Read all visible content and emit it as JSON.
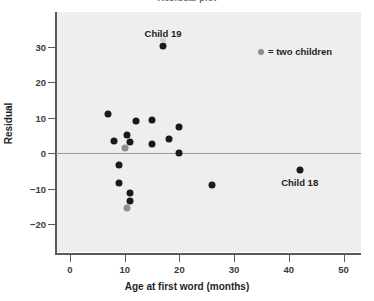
{
  "figure": {
    "clipped_title": "Residual plot"
  },
  "legend": {
    "marker_name": "two-children-marker",
    "text": "= two children",
    "color": "#8d8d8d"
  },
  "annotations": [
    {
      "name": "child-19-label",
      "text": "Child 19",
      "x": 17,
      "y": 33.5
    },
    {
      "name": "child-18-label",
      "text": "Child 18",
      "x": 42,
      "y": -8.5
    }
  ],
  "chart_data": {
    "type": "scatter",
    "title": "Residual plot",
    "xlabel": "Age at first word (months)",
    "ylabel": "Residual",
    "xlim": [
      -3,
      56
    ],
    "ylim": [
      -23,
      35
    ],
    "xticks": [
      0,
      10,
      20,
      30,
      40,
      50
    ],
    "yticks": [
      -20,
      -10,
      0,
      10,
      20,
      30
    ],
    "xtick_labels": [
      "0",
      "10",
      "20",
      "30",
      "40",
      "50"
    ],
    "ytick_labels": [
      "−20",
      "−10",
      "0",
      "10",
      "20",
      "30"
    ],
    "grid": false,
    "reference_line": {
      "y": 0,
      "color": "#9a9a9a"
    },
    "panel_color": "#eeeeee",
    "legend_position": "upper-right",
    "series": [
      {
        "name": "one child",
        "color": "#1a1a1a",
        "points": [
          [
            7.0,
            11.0
          ],
          [
            8.0,
            3.5
          ],
          [
            9.0,
            -3.5
          ],
          [
            9.0,
            -8.5
          ],
          [
            10.5,
            5.0
          ],
          [
            11.0,
            3.0
          ],
          [
            11.0,
            -11.2
          ],
          [
            11.0,
            -13.5
          ],
          [
            12.0,
            9.1
          ],
          [
            15.0,
            9.3
          ],
          [
            15.0,
            2.5
          ],
          [
            17.0,
            30.1
          ],
          [
            18.0,
            4.0
          ],
          [
            20.0,
            7.2
          ],
          [
            20.0,
            0.0
          ],
          [
            26.0,
            -9.1
          ],
          [
            42.0,
            -4.8
          ]
        ]
      },
      {
        "name": "two children",
        "color": "#8d8d8d",
        "points": [
          [
            10.0,
            1.5
          ],
          [
            10.5,
            -15.5
          ]
        ]
      },
      {
        "name": "faint marker",
        "color": "#d2d2d2",
        "points": [
          [
            17.0,
            31.8
          ]
        ]
      }
    ]
  }
}
